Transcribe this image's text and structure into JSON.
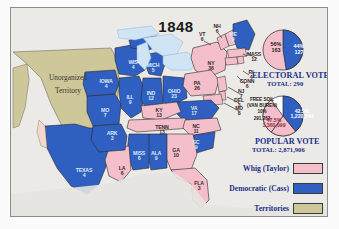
{
  "map": {
    "title": "1848",
    "territory_label_line1": "Unorganized",
    "territory_label_line2": "Territory",
    "colors": {
      "whig": "#f4bfca",
      "democratic": "#2f5fc0",
      "territory": "#cdc79a",
      "water": "#cfe4f5",
      "background": "#eceae6",
      "label_blue": "#1b2f8a"
    },
    "states": [
      {
        "abbr": "VT",
        "votes": "6",
        "party": "whig",
        "x": 191,
        "y": 29
      },
      {
        "abbr": "NH",
        "votes": "6",
        "party": "whig",
        "x": 206,
        "y": 21
      },
      {
        "abbr": "ME",
        "votes": "9",
        "party": "democratic",
        "x": 222,
        "y": 29
      },
      {
        "abbr": "MASS",
        "votes": "12",
        "party": "whig",
        "x": 243,
        "y": 49
      },
      {
        "abbr": "RI",
        "votes": "4",
        "party": "whig",
        "x": 240,
        "y": 67
      },
      {
        "abbr": "CONN",
        "votes": "6",
        "party": "whig",
        "x": 236,
        "y": 76
      },
      {
        "abbr": "NJ",
        "votes": "7",
        "party": "whig",
        "x": 230,
        "y": 86
      },
      {
        "abbr": "DEL",
        "votes": "3",
        "party": "whig",
        "x": 228,
        "y": 95
      },
      {
        "abbr": "MD",
        "votes": "8",
        "party": "whig",
        "x": 228,
        "y": 103
      },
      {
        "abbr": "NY",
        "votes": "36",
        "party": "whig",
        "x": 200,
        "y": 58
      },
      {
        "abbr": "PA",
        "votes": "26",
        "party": "whig",
        "x": 186,
        "y": 78
      },
      {
        "abbr": "VA",
        "votes": "17",
        "party": "democratic",
        "x": 183,
        "y": 103
      },
      {
        "abbr": "OHIO",
        "votes": "23",
        "party": "democratic",
        "x": 163,
        "y": 86
      },
      {
        "abbr": "IND",
        "votes": "12",
        "party": "democratic",
        "x": 140,
        "y": 88
      },
      {
        "abbr": "ILL",
        "votes": "9",
        "party": "democratic",
        "x": 119,
        "y": 92
      },
      {
        "abbr": "MICH",
        "votes": "5",
        "party": "democratic",
        "x": 142,
        "y": 60
      },
      {
        "abbr": "WIS",
        "votes": "4",
        "party": "democratic",
        "x": 122,
        "y": 57
      },
      {
        "abbr": "IOWA",
        "votes": "4",
        "party": "democratic",
        "x": 95,
        "y": 76
      },
      {
        "abbr": "MO",
        "votes": "7",
        "party": "democratic",
        "x": 94,
        "y": 105
      },
      {
        "abbr": "ARK",
        "votes": "3",
        "party": "democratic",
        "x": 101,
        "y": 128
      },
      {
        "abbr": "KY",
        "votes": "13",
        "party": "whig",
        "x": 148,
        "y": 105
      },
      {
        "abbr": "TENN",
        "votes": "13",
        "party": "whig",
        "x": 151,
        "y": 122
      },
      {
        "abbr": "NC",
        "votes": "11",
        "party": "whig",
        "x": 185,
        "y": 121
      },
      {
        "abbr": "SC",
        "votes": "9",
        "party": "democratic",
        "x": 185,
        "y": 137
      },
      {
        "abbr": "GA",
        "votes": "10",
        "party": "whig",
        "x": 165,
        "y": 145
      },
      {
        "abbr": "ALA",
        "votes": "9",
        "party": "democratic",
        "x": 145,
        "y": 148
      },
      {
        "abbr": "MISS",
        "votes": "6",
        "party": "democratic",
        "x": 128,
        "y": 148
      },
      {
        "abbr": "LA",
        "votes": "6",
        "party": "whig",
        "x": 111,
        "y": 163
      },
      {
        "abbr": "TEXAS",
        "votes": "4",
        "party": "democratic",
        "x": 73,
        "y": 165
      },
      {
        "abbr": "FLA",
        "votes": "3",
        "party": "whig",
        "x": 188,
        "y": 178
      }
    ]
  },
  "electoral": {
    "heading": "ELECTORAL  VOTE",
    "total_label": "TOTAL:  290",
    "whig_pct": "56%",
    "whig_votes": "163",
    "dem_pct": "44%",
    "dem_votes": "127"
  },
  "popular": {
    "heading": "POPULAR  VOTE",
    "total_label": "TOTAL:  2,871,906",
    "whig_pct": "47.5%",
    "whig_votes": "1,360,099",
    "dem_pct": "42.5%",
    "dem_votes": "1,220,544",
    "freesoil_line1": "FREE SOIL",
    "freesoil_line2": "(VAN BUREN)",
    "freesoil_line3": "10%",
    "freesoil_line4": "291,263"
  },
  "legend": {
    "items": [
      {
        "label": "Whig (Taylor)",
        "color": "#f4bfca"
      },
      {
        "label": "Democratic (Cass)",
        "color": "#2f5fc0"
      },
      {
        "label": "Territories",
        "color": "#cdc79a"
      }
    ]
  }
}
